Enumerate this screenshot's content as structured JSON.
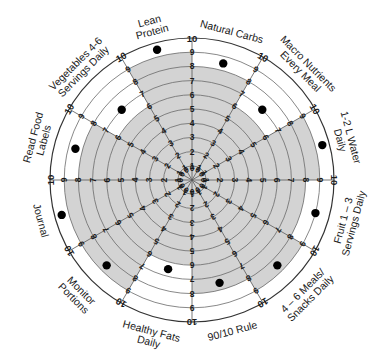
{
  "chart_data": {
    "type": "radial-wheel",
    "title": "",
    "scale": {
      "min": 0,
      "max": 10,
      "ticks": [
        0,
        1,
        2,
        3,
        4,
        5,
        6,
        7,
        8,
        9,
        10
      ]
    },
    "categories": [
      "Natural Carbs",
      "Macro Nutrients Every Meal",
      "1-2 L Water Daily",
      "Fruit 1 – 3 Servings Daily",
      "4 – 6 Meals/ Snacks Daily",
      "90/10 Rule",
      "Healthy Fats Daily",
      "Monitor Portions",
      "Journal",
      "Read Food Labels",
      "Vegetables 4-6 Servings Daily",
      "Lean Protein"
    ],
    "label_lines": [
      [
        "Natural Carbs"
      ],
      [
        "Macro Nutrients",
        "Every Meal"
      ],
      [
        "1-2 L Water",
        "Daily"
      ],
      [
        "Fruit 1 – 3",
        "Servings  Daily"
      ],
      [
        "4 – 6 Meals/",
        "Snacks Daily"
      ],
      [
        "90/10 Rule"
      ],
      [
        "Healthy Fats",
        "Daily"
      ],
      [
        "Monitor",
        "Portions"
      ],
      [
        "Journal"
      ],
      [
        "Read Food",
        "Labels"
      ],
      [
        "Vegetables 4-6",
        "Servings Daily"
      ],
      [
        "Lean",
        "Protein"
      ]
    ],
    "series": [
      {
        "name": "Current (shaded)",
        "values": [
          8,
          6,
          9,
          8,
          9,
          8,
          6,
          9,
          9,
          8,
          6,
          9
        ]
      },
      {
        "name": "Marker (dot)",
        "values": [
          8.5,
          7,
          9.5,
          9,
          8.5,
          7.5,
          6.5,
          8.5,
          9.5,
          8.5,
          7,
          9.5
        ]
      }
    ],
    "colors": {
      "shade": "#d3d3d3",
      "ring": "#555555",
      "dot": "#000000",
      "text": "#1a1a1a"
    }
  }
}
